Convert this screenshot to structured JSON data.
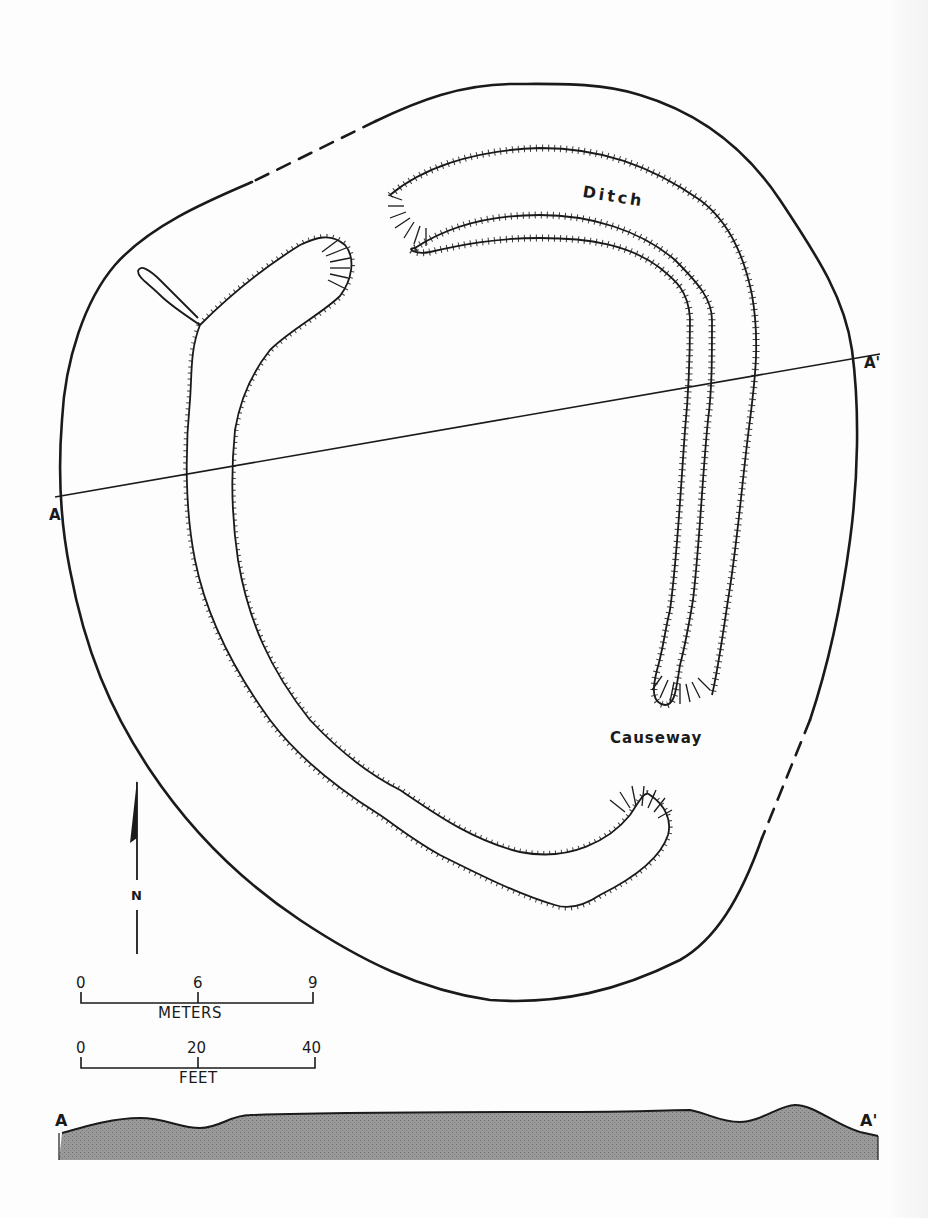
{
  "labels": {
    "ditch": "Ditch",
    "causeway": "Causeway",
    "section_start": "A",
    "section_end": "A'",
    "profile_start": "A",
    "profile_end": "A'",
    "north": "N"
  },
  "scale_meters": {
    "ticks": [
      "0",
      "6",
      "9"
    ],
    "unit": "METERS"
  },
  "scale_feet": {
    "ticks": [
      "0",
      "20",
      "40"
    ],
    "unit": "FEET"
  },
  "colors": {
    "ink": "#1a1a1a",
    "paper": "#fdfdfd",
    "profile_fill": "#8f8f8f"
  },
  "geometry": {
    "outer_solid_1": "M 252,182 C 210,200 150,225 115,265 C 85,300 65,360 62,420 C 58,470 60,520 70,570 C 85,650 110,710 150,770 C 190,830 240,880 300,920 C 360,960 420,990 490,1000 C 560,1005 620,990 680,960 C 715,940 740,900 762,838",
    "outer_dashed_1": "M 376,121 L 252,182",
    "outer_solid_2": "M 376,121 C 420,100 460,85 510,84 C 555,84 600,82 640,95 C 690,110 740,140 780,200 C 820,260 845,300 852,350 C 860,410 858,480 850,540 C 842,600 830,660 810,720",
    "outer_dashed_2": "M 810,720 L 762,838",
    "section_line": {
      "x1": 55,
      "y1": 497,
      "x2": 880,
      "y2": 354
    },
    "ditch_west": "M 200,325 C 225,300 260,270 300,245 C 315,238 330,232 345,245 C 356,258 352,280 340,296 C 320,315 290,330 270,350 C 250,375 240,400 235,430 C 230,480 232,520 238,560 C 248,620 270,670 310,720 C 340,752 370,775 400,790 C 430,810 470,840 520,852 C 570,862 610,840 630,815 C 640,800 645,790 650,795 C 665,805 672,820 668,835 C 660,860 630,880 600,895 C 585,905 570,910 555,905 C 520,895 480,875 440,855 C 410,838 395,825 380,815 C 340,790 300,760 270,720 C 230,665 205,610 195,560 C 185,510 185,450 190,400 C 192,375 190,350 200,325 Z",
    "ditch_channel": "M 200,325 C 185,315 170,305 160,295 C 148,283 138,278 138,271 C 140,264 150,270 160,280 C 172,292 185,305 198,318",
    "ditch_east": "M 415,248 C 450,225 490,215 540,215 C 590,215 640,230 675,260 C 700,285 712,300 712,320 C 712,360 712,390 708,420 C 702,480 700,540 693,600 C 688,630 684,650 680,665 C 676,690 675,705 665,705 C 652,703 652,690 657,670 C 663,650 665,630 670,610 C 677,560 680,500 685,430 C 690,380 690,340 690,318 C 688,290 675,280 660,268 C 630,245 590,238 540,238 C 495,238 460,245 430,252 C 415,255 405,248 415,248 Z",
    "ditch_east_outer": "M 390,195 C 420,170 470,150 540,148 C 600,148 650,165 700,200 C 730,222 745,260 752,295 C 760,340 755,380 750,420 C 742,480 738,540 728,600 C 722,640 718,670 712,695",
    "profile_top": "M 62,1133 C 90,1125 115,1118 140,1118 C 165,1118 180,1128 200,1128 C 220,1128 230,1115 250,1115 C 350,1112 450,1112 550,1112 C 640,1112 670,1110 690,1110 C 710,1114 720,1122 740,1122 C 760,1122 780,1105 795,1105 C 815,1105 835,1125 860,1132 L 878,1136"
  }
}
